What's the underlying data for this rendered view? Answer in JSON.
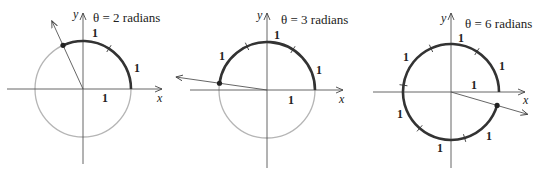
{
  "diagrams": [
    {
      "title": "θ = 2 radians",
      "theta": 2,
      "center": [
        83,
        89
      ],
      "radius": 48,
      "x_axis": [
        7,
        162
      ],
      "y_axis": [
        13,
        164
      ],
      "title_pos": [
        93,
        22
      ],
      "axis_labels": {
        "x": "x",
        "y": "y",
        "x_pos": [
          157,
          102
        ],
        "y_pos": [
          73,
          18
        ]
      },
      "unit_labels": [
        {
          "text": "1",
          "pos": [
            92,
            37
          ]
        },
        {
          "text": "1",
          "pos": [
            134,
            72
          ]
        },
        {
          "text": "1",
          "pos": [
            102,
            102
          ]
        }
      ],
      "ray_extend": 75,
      "show_full_circle": true
    },
    {
      "title": "θ = 3 radians",
      "theta": 3,
      "center": [
        267,
        90
      ],
      "radius": 48,
      "x_axis": [
        190,
        343
      ],
      "y_axis": [
        13,
        168
      ],
      "title_pos": [
        281,
        24
      ],
      "axis_labels": {
        "x": "x",
        "y": "y",
        "x_pos": [
          339,
          103
        ],
        "y_pos": [
          257,
          19
        ]
      },
      "unit_labels": [
        {
          "text": "1",
          "pos": [
            274,
            39
          ]
        },
        {
          "text": "1",
          "pos": [
            219,
            60
          ]
        },
        {
          "text": "1",
          "pos": [
            316,
            74
          ]
        },
        {
          "text": "1",
          "pos": [
            288,
            104
          ]
        }
      ],
      "ray_extend": 92,
      "show_full_circle": true
    },
    {
      "title": "θ = 6 radians",
      "theta": 6,
      "center": [
        451,
        92
      ],
      "radius": 48,
      "x_axis": [
        373,
        525
      ],
      "y_axis": [
        13,
        168
      ],
      "title_pos": [
        465,
        28
      ],
      "axis_labels": {
        "x": "x",
        "y": "y",
        "x_pos": [
          523,
          104
        ],
        "y_pos": [
          441,
          22
        ]
      },
      "unit_labels": [
        {
          "text": "1",
          "pos": [
            458,
            42
          ]
        },
        {
          "text": "1",
          "pos": [
            403,
            61
          ]
        },
        {
          "text": "1",
          "pos": [
            499,
            70
          ]
        },
        {
          "text": "1",
          "pos": [
            471,
            89
          ]
        },
        {
          "text": "1",
          "pos": [
            397,
            118
          ]
        },
        {
          "text": "1",
          "pos": [
            486,
            140
          ]
        },
        {
          "text": "1",
          "pos": [
            437,
            152
          ]
        }
      ],
      "ray_extend": 80,
      "show_full_circle": false
    }
  ],
  "colors": {
    "axis": "#555555",
    "arc": "#333333",
    "circle": "#b5b5b5",
    "text": "#222222",
    "point": "#222222"
  }
}
